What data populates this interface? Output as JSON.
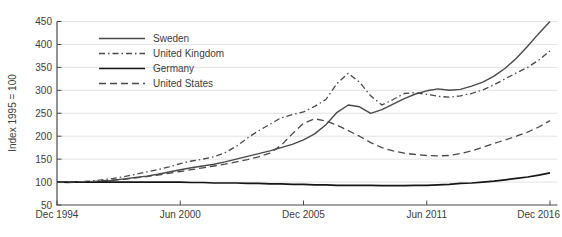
{
  "chart_data": {
    "type": "line",
    "title": "",
    "xlabel": "",
    "ylabel": "Index 1995 = 100",
    "x_tick_labels": [
      "Dec 1994",
      "Jun 2000",
      "Dec 2005",
      "Jun 2011",
      "Dec 2016"
    ],
    "x_tick_positions": [
      0,
      5.5,
      11,
      16.5,
      22
    ],
    "y_ticks": [
      50,
      100,
      150,
      200,
      250,
      300,
      350,
      400,
      450
    ],
    "ylim": [
      50,
      450
    ],
    "xlim": [
      0,
      22
    ],
    "x_unit": "years since Dec 1994 (half-year sampling)",
    "grid": "horizontal-light",
    "legend_position": "top-left-inside",
    "colors": {
      "gray_series": "#4a4a4a",
      "black_series": "#161616",
      "gridline": "#e3e3e3",
      "axis": "#4a4a4a",
      "text": "#3d3d3d"
    },
    "x": [
      0,
      0.5,
      1,
      1.5,
      2,
      2.5,
      3,
      3.5,
      4,
      4.5,
      5,
      5.5,
      6,
      6.5,
      7,
      7.5,
      8,
      8.5,
      9,
      9.5,
      10,
      10.5,
      11,
      11.5,
      12,
      12.5,
      13,
      13.5,
      14,
      14.5,
      15,
      15.5,
      16,
      16.5,
      17,
      17.5,
      18,
      18.5,
      19,
      19.5,
      20,
      20.5,
      21,
      21.5,
      22
    ],
    "series": [
      {
        "name": "Sweden",
        "style": "solid",
        "color": "#4a4a4a",
        "width": 1.4,
        "values": [
          100,
          99,
          100,
          100,
          101,
          104,
          107,
          110,
          113,
          117,
          122,
          127,
          131,
          135,
          139,
          144,
          150,
          156,
          162,
          168,
          175,
          182,
          192,
          205,
          225,
          252,
          268,
          264,
          250,
          258,
          270,
          282,
          292,
          299,
          303,
          300,
          302,
          309,
          318,
          331,
          348,
          370,
          396,
          424,
          450
        ]
      },
      {
        "name": "United Kingdom",
        "style": "dash-dot",
        "color": "#4a4a4a",
        "width": 1.3,
        "values": [
          100,
          100,
          101,
          102,
          105,
          108,
          112,
          117,
          122,
          127,
          133,
          140,
          146,
          150,
          155,
          164,
          178,
          196,
          212,
          226,
          240,
          247,
          253,
          265,
          280,
          315,
          337,
          318,
          288,
          268,
          280,
          293,
          295,
          291,
          287,
          285,
          288,
          293,
          301,
          312,
          325,
          338,
          350,
          366,
          386
        ]
      },
      {
        "name": "Germany",
        "style": "solid",
        "color": "#161616",
        "width": 1.7,
        "values": [
          100,
          100,
          100,
          100,
          100,
          100,
          100,
          100,
          100,
          100,
          100,
          100,
          99,
          99,
          98,
          98,
          98,
          97,
          97,
          96,
          96,
          95,
          95,
          94,
          94,
          93,
          93,
          93,
          93,
          92,
          92,
          92,
          93,
          93,
          94,
          95,
          97,
          98,
          100,
          102,
          105,
          108,
          111,
          115,
          120
        ]
      },
      {
        "name": "United States",
        "style": "dashed",
        "color": "#4a4a4a",
        "width": 1.3,
        "values": [
          100,
          100,
          101,
          101,
          103,
          104,
          106,
          109,
          112,
          115,
          119,
          123,
          127,
          131,
          135,
          139,
          144,
          149,
          155,
          163,
          180,
          205,
          228,
          238,
          233,
          224,
          212,
          200,
          186,
          175,
          168,
          163,
          160,
          158,
          157,
          158,
          162,
          168,
          176,
          184,
          192,
          200,
          209,
          220,
          234
        ]
      }
    ]
  }
}
